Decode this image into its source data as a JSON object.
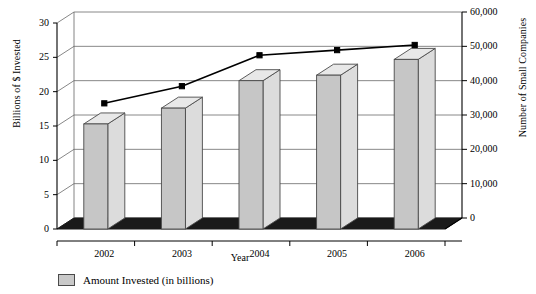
{
  "chart_data": {
    "type": "bar",
    "title": "",
    "xlabel": "Year",
    "categories": [
      "2002",
      "2003",
      "2004",
      "2005",
      "2006"
    ],
    "series": [
      {
        "name": "Amount Invested (in billions)",
        "type": "bar",
        "axis": "left",
        "values": [
          15.3,
          17.6,
          21.6,
          22.4,
          24.7
        ]
      },
      {
        "name": "Number of Small Companies",
        "type": "line",
        "axis": "right",
        "values": [
          35000,
          40000,
          49000,
          50500,
          52000
        ]
      }
    ],
    "left_axis": {
      "label": "Billions of $ Invested",
      "ticks": [
        "0",
        "5",
        "10",
        "15",
        "20",
        "25",
        "30"
      ],
      "values": [
        0,
        5,
        10,
        15,
        20,
        25,
        30
      ],
      "min": 0,
      "max": 30
    },
    "right_axis": {
      "label": "Number of Small Companies",
      "ticks": [
        "0",
        "10,000",
        "20,000",
        "30,000",
        "40,000",
        "50,000",
        "60,000"
      ],
      "values": [
        0,
        10000,
        20000,
        30000,
        40000,
        50000,
        60000
      ],
      "min": 0,
      "max": 60000
    },
    "grid": true,
    "legend_position": "bottom-left",
    "colors": {
      "bar_front": "#c6c6c6",
      "bar_top": "#e8e8e8",
      "bar_side": "#dcdcdc",
      "bar_outline": "#4a4a4a",
      "line": "#000000",
      "grid": "#888888",
      "floor": "#1a1a1a",
      "background": "#ffffff"
    }
  },
  "legend": {
    "swatch_name": "bar-color-swatch",
    "label": "Amount Invested (in billions)"
  },
  "axes": {
    "left_title": "Billions of $ Invested",
    "right_title": "Number of Small Companies",
    "x_title": "Year"
  }
}
